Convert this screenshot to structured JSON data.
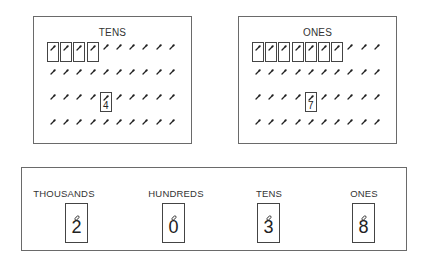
{
  "tens_panel": {
    "title": "TENS",
    "rows": 4,
    "hooks_per_row": 10,
    "bundled_count": 4,
    "digit_card": {
      "row": 3,
      "column": 5,
      "digit": "4"
    }
  },
  "ones_panel": {
    "title": "ONES",
    "rows": 4,
    "hooks_per_row": 10,
    "bundled_count": 7,
    "digit_card": {
      "row": 3,
      "column": 5,
      "digit": "7"
    }
  },
  "place_value_chart": {
    "places": [
      {
        "label": "THOUSANDS",
        "digit": "2"
      },
      {
        "label": "HUNDREDS",
        "digit": "0"
      },
      {
        "label": "TENS",
        "digit": "3"
      },
      {
        "label": "ONES",
        "digit": "8"
      }
    ]
  },
  "colors": {
    "border": "#6a6a6a",
    "ink": "#222222",
    "background": "#ffffff"
  }
}
